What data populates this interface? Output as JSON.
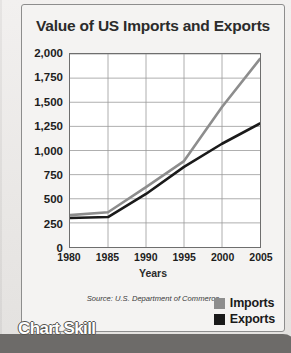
{
  "banner": {
    "label": "Chart Skill"
  },
  "legend": {
    "entries": [
      {
        "label": "Imports",
        "color": "#8d8d8d",
        "icon": "legend-swatch"
      },
      {
        "label": "Exports",
        "color": "#1a1a1a",
        "icon": "legend-swatch"
      }
    ]
  },
  "chart_data": {
    "type": "line",
    "title": "Value of US Imports and Exports",
    "xlabel": "Years",
    "ylabel": "",
    "source": "Source: U.S. Department of Commerce",
    "categories": [
      "1980",
      "1985",
      "1990",
      "1995",
      "2000",
      "2005"
    ],
    "x": [
      1980,
      1985,
      1990,
      1995,
      2000,
      2005
    ],
    "xlim": [
      1980,
      2005
    ],
    "ylim": [
      0,
      2000
    ],
    "yticks": [
      "0",
      "250",
      "500",
      "750",
      "1,000",
      "1,250",
      "1,500",
      "1,750",
      "2,000"
    ],
    "ytick_values": [
      0,
      250,
      500,
      750,
      1000,
      1250,
      1500,
      1750,
      2000
    ],
    "grid": true,
    "legend_position": "bottom-right",
    "series": [
      {
        "name": "Imports",
        "color": "#8d8d8d",
        "values": [
          330,
          360,
          620,
          890,
          1450,
          1950
        ]
      },
      {
        "name": "Exports",
        "color": "#1a1a1a",
        "values": [
          300,
          310,
          550,
          830,
          1070,
          1280
        ]
      }
    ]
  }
}
